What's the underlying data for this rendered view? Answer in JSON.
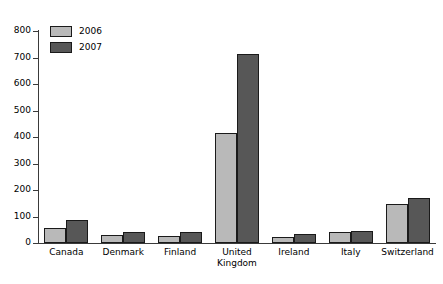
{
  "chart_data": {
    "type": "bar",
    "title": "",
    "subtitle": "",
    "xlabel": "",
    "ylabel": "",
    "categories": [
      "Canada",
      "Denmark",
      "Finland",
      "United Kingdom",
      "Ireland",
      "Italy",
      "Switzerland"
    ],
    "category_label_lines": [
      [
        "Canada"
      ],
      [
        "Denmark"
      ],
      [
        "Finland"
      ],
      [
        "United",
        "Kingdom"
      ],
      [
        "Ireland"
      ],
      [
        "Italy"
      ],
      [
        "Switzerland"
      ]
    ],
    "series": [
      {
        "name": "2006",
        "color": "#b9b9b9",
        "values": [
          58,
          30,
          28,
          415,
          23,
          42,
          147
        ]
      },
      {
        "name": "2007",
        "color": "#575757",
        "values": [
          88,
          42,
          43,
          712,
          33,
          47,
          168
        ]
      }
    ],
    "ylim": [
      0,
      800
    ],
    "yticks": [
      0,
      100,
      200,
      300,
      400,
      500,
      600,
      700,
      800
    ],
    "ytick_labels": [
      "0",
      "100",
      "200",
      "300",
      "400",
      "500",
      "600",
      "700",
      "800"
    ],
    "grid": false,
    "legend_position": "top-left",
    "legend_entries": [
      "2006",
      "2007"
    ],
    "bar_border_color": "#1a1a1a",
    "axis_color": "#3a3a3a",
    "background_color": "#ffffff"
  }
}
